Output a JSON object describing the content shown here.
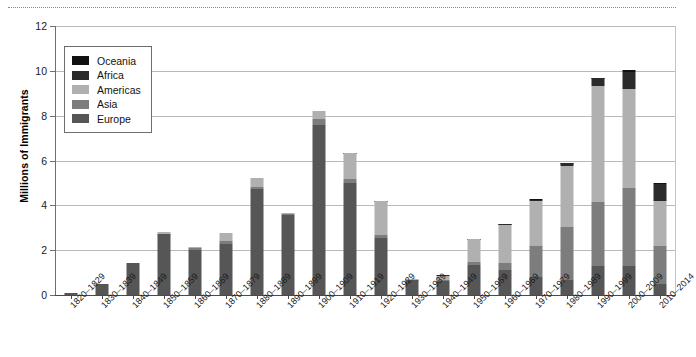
{
  "chart_data": {
    "type": "bar",
    "subtype": "stacked-bar",
    "title": "",
    "xlabel": "",
    "ylabel": "Millions of Immigrants",
    "ylim": [
      0,
      12
    ],
    "yticks": [
      0,
      2,
      4,
      6,
      8,
      10,
      12
    ],
    "ytick_labels": [
      "0",
      "2",
      "4",
      "6",
      "8",
      "10",
      "12"
    ],
    "grid": true,
    "legend_position": "upper-left",
    "categories": [
      "1820–1829",
      "1830–1839",
      "1840–1849",
      "1850–1859",
      "1860–1869",
      "1870–1879",
      "1880–1889",
      "1890–1899",
      "1900–1909",
      "1910–1919",
      "1920–1929",
      "1930–1939",
      "1940–1949",
      "1950–1959",
      "1960–1969",
      "1970–1979",
      "1980–1989",
      "1990–1999",
      "2000–2009",
      "2010–2014"
    ],
    "series": [
      {
        "name": "Europe",
        "color": "#565656",
        "values": [
          0.1,
          0.48,
          1.43,
          2.7,
          2.03,
          2.27,
          4.74,
          3.56,
          7.57,
          4.99,
          2.56,
          0.65,
          0.62,
          1.33,
          1.12,
          0.8,
          0.67,
          1.31,
          1.3,
          0.5
        ]
      },
      {
        "name": "Asia",
        "color": "#7d7d7d",
        "values": [
          0.0,
          0.0,
          0.0,
          0.04,
          0.06,
          0.12,
          0.07,
          0.07,
          0.28,
          0.2,
          0.1,
          0.02,
          0.04,
          0.15,
          0.3,
          1.4,
          2.37,
          2.86,
          3.47,
          1.7
        ]
      },
      {
        "name": "Americas",
        "color": "#b0b0b0",
        "values": [
          0.01,
          0.0,
          0.0,
          0.05,
          0.06,
          0.36,
          0.43,
          0.04,
          0.36,
          1.14,
          1.52,
          0.03,
          0.21,
          1.0,
          1.72,
          1.98,
          2.7,
          5.14,
          4.44,
          2.0
        ]
      },
      {
        "name": "Africa",
        "color": "#2b2b2b",
        "values": [
          0.0,
          0.0,
          0.0,
          0.0,
          0.0,
          0.0,
          0.0,
          0.0,
          0.0,
          0.01,
          0.01,
          0.0,
          0.01,
          0.02,
          0.03,
          0.08,
          0.14,
          0.35,
          0.76,
          0.75
        ]
      },
      {
        "name": "Oceania",
        "color": "#111111",
        "values": [
          0.0,
          0.0,
          0.0,
          0.0,
          0.0,
          0.0,
          0.0,
          0.0,
          0.0,
          0.01,
          0.01,
          0.0,
          0.0,
          0.01,
          0.02,
          0.02,
          0.03,
          0.04,
          0.06,
          0.04
        ]
      }
    ],
    "totals": [
      0.11,
      0.48,
      1.43,
      2.79,
      2.15,
      2.75,
      5.24,
      3.67,
      8.21,
      6.35,
      4.2,
      0.7,
      0.86,
      2.51,
      3.19,
      4.28,
      5.91,
      9.7,
      10.03,
      4.99
    ]
  },
  "legend": {
    "items": [
      {
        "label": "Oceania",
        "color": "#111111"
      },
      {
        "label": "Africa",
        "color": "#2b2b2b"
      },
      {
        "label": "Americas",
        "color": "#b0b0b0"
      },
      {
        "label": "Asia",
        "color": "#7d7d7d"
      },
      {
        "label": "Europe",
        "color": "#565656"
      }
    ]
  }
}
